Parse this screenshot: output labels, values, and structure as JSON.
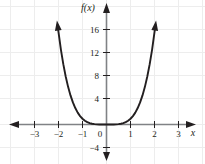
{
  "chart_data": {
    "type": "line",
    "title": "",
    "function_label": "f(x)",
    "expression": "f(x) = x^4",
    "xlabel": "x",
    "ylabel": "f(x)",
    "xlim": [
      -3.9,
      4.0
    ],
    "ylim": [
      -5.6,
      18.4
    ],
    "grid": true,
    "legend": null,
    "x_ticks": [
      -3,
      -2,
      -1,
      0,
      1,
      2,
      3
    ],
    "x_tick_labels": [
      "−3",
      "−2",
      "−1",
      "0",
      "1",
      "2",
      "3"
    ],
    "y_ticks": [
      -4,
      4,
      8,
      12,
      16
    ],
    "y_tick_labels": [
      "−4",
      "4",
      "8",
      "12",
      "16"
    ],
    "x": [
      -2.04,
      -1.9,
      -1.8,
      -1.7,
      -1.6,
      -1.5,
      -1.4,
      -1.3,
      -1.2,
      -1.1,
      -1.0,
      -0.9,
      -0.8,
      -0.7,
      -0.6,
      -0.5,
      -0.4,
      -0.3,
      -0.2,
      -0.1,
      0.0,
      0.1,
      0.2,
      0.3,
      0.4,
      0.5,
      0.6,
      0.7,
      0.8,
      0.9,
      1.0,
      1.1,
      1.2,
      1.3,
      1.4,
      1.5,
      1.6,
      1.7,
      1.8,
      1.9,
      2.04
    ],
    "values": [
      17.3,
      13.03,
      10.49,
      8.35,
      6.55,
      5.06,
      3.84,
      2.86,
      2.07,
      1.46,
      1.0,
      0.66,
      0.41,
      0.24,
      0.13,
      0.06,
      0.03,
      0.01,
      0.0,
      0.0,
      0.0,
      0.0,
      0.0,
      0.01,
      0.03,
      0.06,
      0.13,
      0.24,
      0.41,
      0.66,
      1.0,
      1.46,
      2.07,
      2.86,
      3.84,
      5.06,
      6.55,
      8.35,
      10.49,
      13.03,
      17.3
    ],
    "series": [
      {
        "name": "f(x) = x^4",
        "color": "#231f20",
        "arrow_start": true,
        "arrow_end": true
      }
    ],
    "annotations": []
  },
  "style": {
    "curve_color": "#231f20",
    "axis_color": "#808285",
    "grid_color": "#ededed",
    "text_color": "#231f20",
    "background": "#ffffff"
  }
}
